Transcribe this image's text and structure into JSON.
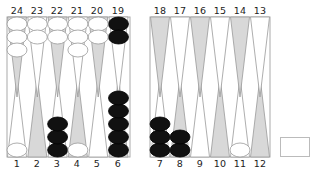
{
  "game": "backgammon",
  "colors": {
    "light_point": "#ffffff",
    "dark_point": "#d8d8d8",
    "point_stroke": "#999999",
    "white_checker": "#ffffff",
    "black_checker": "#111111",
    "frame": "#aaaaaa"
  },
  "top_labels": [
    "24",
    "23",
    "22",
    "21",
    "20",
    "19",
    "18",
    "17",
    "16",
    "15",
    "14",
    "13"
  ],
  "bottom_labels": [
    "1",
    "2",
    "3",
    "4",
    "5",
    "6",
    "7",
    "8",
    "9",
    "10",
    "11",
    "12"
  ],
  "points": {
    "1": {
      "color": "white",
      "count": 1
    },
    "3": {
      "color": "black",
      "count": 3
    },
    "4": {
      "color": "white",
      "count": 1
    },
    "6": {
      "color": "black",
      "count": 5
    },
    "7": {
      "color": "black",
      "count": 3
    },
    "8": {
      "color": "black",
      "count": 2
    },
    "11": {
      "color": "white",
      "count": 1
    },
    "19": {
      "color": "black",
      "count": 2
    },
    "20": {
      "color": "white",
      "count": 2
    },
    "21": {
      "color": "white",
      "count": 3
    },
    "22": {
      "color": "white",
      "count": 2
    },
    "23": {
      "color": "white",
      "count": 2
    },
    "24": {
      "color": "white",
      "count": 3
    }
  },
  "cube": {
    "value": ""
  }
}
